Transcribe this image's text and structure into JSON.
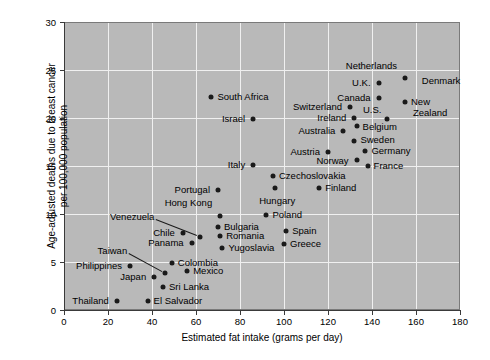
{
  "chart_data": {
    "type": "scatter",
    "title": "",
    "xlabel": "Estimated fat intake (grams per day)",
    "ylabel": "Age-adjusted deaths due to breast cancer per 100,000 population",
    "ylabel_line1": "Age-adjusted deaths due to breast cancer",
    "ylabel_line2": "per 100,000 population",
    "xlim": [
      0,
      180
    ],
    "ylim": [
      0,
      30
    ],
    "xticks": [
      0,
      20,
      40,
      60,
      80,
      100,
      120,
      140,
      160,
      180
    ],
    "yticks": [
      0,
      5,
      10,
      15,
      20,
      25,
      30
    ],
    "grid": true,
    "legend": "none",
    "point_color": "#1a1a1a",
    "plot_background": "#b9b9b9",
    "gridline_color": "#f0f0f0",
    "points": [
      {
        "label": "Thailand",
        "x": 24,
        "y": 0.9,
        "lx": -8,
        "ly": 0,
        "anchor": "end"
      },
      {
        "label": "El Salvador",
        "x": 38,
        "y": 0.9,
        "lx": 6,
        "ly": 0,
        "anchor": "start"
      },
      {
        "label": "Sri Lanka",
        "x": 45,
        "y": 2.4,
        "lx": 6,
        "ly": 0,
        "anchor": "start"
      },
      {
        "label": "Japan",
        "x": 41,
        "y": 3.4,
        "lx": -8,
        "ly": 0,
        "anchor": "end"
      },
      {
        "label": "Mexico",
        "x": 56,
        "y": 4.1,
        "lx": 6,
        "ly": 0,
        "anchor": "start"
      },
      {
        "label": "Philippines",
        "x": 30,
        "y": 4.6,
        "lx": -8,
        "ly": 0,
        "anchor": "end"
      },
      {
        "label": "Colombia",
        "x": 49,
        "y": 4.9,
        "lx": 6,
        "ly": 0,
        "anchor": "start"
      },
      {
        "label": "Taiwan",
        "x": 46,
        "y": 3.9,
        "lx": -38,
        "ly": -22,
        "anchor": "end",
        "leader": true
      },
      {
        "label": "Yugoslavia",
        "x": 72,
        "y": 6.5,
        "lx": 6,
        "ly": 0,
        "anchor": "start"
      },
      {
        "label": "Panama",
        "x": 58,
        "y": 7.0,
        "lx": -8,
        "ly": 0,
        "anchor": "end"
      },
      {
        "label": "Greece",
        "x": 100,
        "y": 6.9,
        "lx": 6,
        "ly": 0,
        "anchor": "start"
      },
      {
        "label": "Romania",
        "x": 71,
        "y": 7.7,
        "lx": 6,
        "ly": 0,
        "anchor": "start"
      },
      {
        "label": "Venezuela",
        "x": 62,
        "y": 7.6,
        "lx": -46,
        "ly": -20,
        "anchor": "end",
        "leader": true
      },
      {
        "label": "Chile",
        "x": 54,
        "y": 8.0,
        "lx": -8,
        "ly": 0,
        "anchor": "end"
      },
      {
        "label": "Spain",
        "x": 101,
        "y": 8.2,
        "lx": 6,
        "ly": 0,
        "anchor": "start"
      },
      {
        "label": "Bulgaria",
        "x": 70,
        "y": 8.6,
        "lx": 6,
        "ly": 0,
        "anchor": "start"
      },
      {
        "label": "Hong Kong",
        "x": 71,
        "y": 9.8,
        "lx": -8,
        "ly": -13,
        "anchor": "end"
      },
      {
        "label": "Poland",
        "x": 92,
        "y": 9.9,
        "lx": 6,
        "ly": 0,
        "anchor": "start"
      },
      {
        "label": "Hungary",
        "x": 96,
        "y": 12.7,
        "lx": 2,
        "ly": 13,
        "anchor": "middle"
      },
      {
        "label": "Portugal",
        "x": 70,
        "y": 12.5,
        "lx": -8,
        "ly": 0,
        "anchor": "end"
      },
      {
        "label": "Finland",
        "x": 116,
        "y": 12.7,
        "lx": 6,
        "ly": 0,
        "anchor": "start"
      },
      {
        "label": "Czechoslovakia",
        "x": 95,
        "y": 14.0,
        "lx": 6,
        "ly": 0,
        "anchor": "start"
      },
      {
        "label": "Italy",
        "x": 86,
        "y": 15.1,
        "lx": -8,
        "ly": 0,
        "anchor": "end"
      },
      {
        "label": "France",
        "x": 138,
        "y": 15.0,
        "lx": 6,
        "ly": 0,
        "anchor": "start"
      },
      {
        "label": "Norway",
        "x": 133,
        "y": 15.6,
        "lx": -8,
        "ly": 1,
        "anchor": "end"
      },
      {
        "label": "Austria",
        "x": 120,
        "y": 16.5,
        "lx": -8,
        "ly": 0,
        "anchor": "end"
      },
      {
        "label": "Germany",
        "x": 137,
        "y": 16.6,
        "lx": 6,
        "ly": 0,
        "anchor": "start"
      },
      {
        "label": "Sweden",
        "x": 132,
        "y": 17.6,
        "lx": 6,
        "ly": -1,
        "anchor": "start"
      },
      {
        "label": "Australia",
        "x": 127,
        "y": 18.6,
        "lx": -8,
        "ly": 0,
        "anchor": "end"
      },
      {
        "label": "Belgium",
        "x": 133,
        "y": 19.2,
        "lx": 6,
        "ly": 1,
        "anchor": "start"
      },
      {
        "label": "Ireland",
        "x": 132,
        "y": 20.0,
        "lx": -8,
        "ly": 0,
        "anchor": "end"
      },
      {
        "label": "U.S.",
        "x": 147,
        "y": 19.9,
        "lx": -6,
        "ly": -9,
        "anchor": "end"
      },
      {
        "label": "Israel",
        "x": 86,
        "y": 19.9,
        "lx": -8,
        "ly": 0,
        "anchor": "end"
      },
      {
        "label": "Switzerland",
        "x": 130,
        "y": 21.1,
        "lx": -8,
        "ly": 0,
        "anchor": "end"
      },
      {
        "label": "Canada",
        "x": 143,
        "y": 22.1,
        "lx": -8,
        "ly": 0,
        "anchor": "end"
      },
      {
        "label": "South Africa",
        "x": 67,
        "y": 22.2,
        "lx": 6,
        "ly": 0,
        "anchor": "start"
      },
      {
        "label": "New",
        "x": 155,
        "y": 21.7,
        "lx": 6,
        "ly": 0,
        "anchor": "start"
      },
      {
        "label": "Zealand",
        "x": 155,
        "y": 21.7,
        "lx": 8,
        "ly": 11,
        "anchor": "start",
        "nodot": true
      },
      {
        "label": "Denmark",
        "x": 159,
        "y": 22.8,
        "lx": 8,
        "ly": -10,
        "anchor": "start",
        "nodot": true
      },
      {
        "label": "U.K.",
        "x": 143,
        "y": 23.6,
        "lx": -8,
        "ly": 0,
        "anchor": "end"
      },
      {
        "label": "Netherlands",
        "x": 155,
        "y": 24.2,
        "lx": -8,
        "ly": -12,
        "anchor": "end"
      }
    ]
  }
}
